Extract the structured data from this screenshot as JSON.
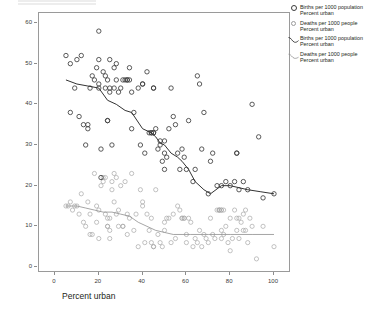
{
  "axes": {
    "y_title": "Rate per 1000",
    "x_title": "Percent urban",
    "y_ticks": [
      "0",
      "10",
      "20",
      "30",
      "40",
      "50",
      "60"
    ],
    "x_ticks": [
      "0",
      "20",
      "40",
      "60",
      "80",
      "100"
    ]
  },
  "legend": {
    "items": [
      {
        "key": "circle-dark",
        "line1": "Births per 1000 population",
        "line2": "Percent urban"
      },
      {
        "key": "circle-light",
        "line1": "Deaths per 1000 people",
        "line2": "Percent urban"
      },
      {
        "key": "curve-dark",
        "line1": "Births per 1000 population",
        "line2": "Percent urban"
      },
      {
        "key": "curve-light",
        "line1": "Deaths per 1000 people",
        "line2": "Percent urban"
      }
    ]
  },
  "colors": {
    "births_marker": "#3d3d3d",
    "deaths_marker": "#a8a8a8",
    "births_line": "#333333",
    "deaths_line": "#8f8f8f",
    "frame": "#9a9a9a",
    "background": "#ffffff"
  },
  "chart_data": {
    "type": "scatter",
    "title": "",
    "xlabel": "Percent urban",
    "ylabel": "Rate per 1000",
    "xlim": [
      0,
      100
    ],
    "ylim": [
      0,
      60
    ],
    "xticks": [
      0,
      20,
      40,
      60,
      80,
      100
    ],
    "yticks": [
      0,
      10,
      20,
      30,
      40,
      50,
      60
    ],
    "grid": false,
    "legend_position": "right-outside",
    "series": [
      {
        "name": "Births per 1000 population",
        "marker": "open-circle",
        "color": "#3d3d3d",
        "points": [
          [
            5,
            52
          ],
          [
            7,
            50
          ],
          [
            7,
            38
          ],
          [
            9,
            44
          ],
          [
            10,
            51
          ],
          [
            11,
            37
          ],
          [
            12,
            52
          ],
          [
            13,
            35
          ],
          [
            14,
            30
          ],
          [
            15,
            34
          ],
          [
            15,
            35
          ],
          [
            16,
            44
          ],
          [
            17,
            47
          ],
          [
            18,
            46
          ],
          [
            19,
            49
          ],
          [
            20,
            58
          ],
          [
            20,
            51
          ],
          [
            20,
            45
          ],
          [
            20,
            44
          ],
          [
            21,
            29
          ],
          [
            21,
            22
          ],
          [
            22,
            48
          ],
          [
            23,
            47
          ],
          [
            23,
            44
          ],
          [
            24,
            36
          ],
          [
            24,
            36
          ],
          [
            24,
            46
          ],
          [
            25,
            44
          ],
          [
            25,
            43
          ],
          [
            25,
            51
          ],
          [
            26,
            30
          ],
          [
            27,
            44
          ],
          [
            27,
            49
          ],
          [
            28,
            50
          ],
          [
            28,
            46
          ],
          [
            29,
            43
          ],
          [
            30,
            44
          ],
          [
            31,
            46
          ],
          [
            32,
            46
          ],
          [
            33,
            46
          ],
          [
            33,
            46
          ],
          [
            34,
            46
          ],
          [
            34,
            49
          ],
          [
            35,
            43
          ],
          [
            35,
            34
          ],
          [
            36,
            38
          ],
          [
            38,
            44
          ],
          [
            39,
            30
          ],
          [
            40,
            45
          ],
          [
            40,
            45
          ],
          [
            41,
            28
          ],
          [
            42,
            48
          ],
          [
            43,
            33
          ],
          [
            44,
            33
          ],
          [
            44,
            33
          ],
          [
            45,
            33
          ],
          [
            45,
            33
          ],
          [
            45,
            44
          ],
          [
            45,
            44
          ],
          [
            46,
            34
          ],
          [
            47,
            29
          ],
          [
            48,
            31
          ],
          [
            48,
            30
          ],
          [
            49,
            26
          ],
          [
            50,
            31
          ],
          [
            50,
            28
          ],
          [
            50,
            24
          ],
          [
            51,
            27
          ],
          [
            52,
            34
          ],
          [
            53,
            44
          ],
          [
            54,
            37
          ],
          [
            55,
            35
          ],
          [
            56,
            28
          ],
          [
            57,
            24
          ],
          [
            58,
            29
          ],
          [
            59,
            27
          ],
          [
            60,
            24
          ],
          [
            61,
            36
          ],
          [
            63,
            21
          ],
          [
            64,
            24
          ],
          [
            65,
            47
          ],
          [
            66,
            45
          ],
          [
            67,
            29
          ],
          [
            68,
            38
          ],
          [
            70,
            18
          ],
          [
            71,
            26
          ],
          [
            72,
            28
          ],
          [
            74,
            20
          ],
          [
            76,
            20
          ],
          [
            78,
            21
          ],
          [
            80,
            20
          ],
          [
            82,
            21
          ],
          [
            83,
            28
          ],
          [
            83,
            28
          ],
          [
            84,
            19
          ],
          [
            86,
            21
          ],
          [
            88,
            19
          ],
          [
            90,
            40
          ],
          [
            93,
            32
          ],
          [
            95,
            17
          ],
          [
            100,
            18
          ]
        ]
      },
      {
        "name": "Deaths per 1000 people",
        "marker": "open-circle",
        "color": "#a8a8a8",
        "points": [
          [
            5,
            15
          ],
          [
            6,
            15
          ],
          [
            7,
            16
          ],
          [
            8,
            14
          ],
          [
            9,
            15
          ],
          [
            10,
            15
          ],
          [
            11,
            13
          ],
          [
            12,
            18
          ],
          [
            13,
            11
          ],
          [
            14,
            10
          ],
          [
            15,
            16
          ],
          [
            16,
            13
          ],
          [
            16,
            8
          ],
          [
            17,
            8
          ],
          [
            18,
            23
          ],
          [
            19,
            15
          ],
          [
            19,
            11
          ],
          [
            20,
            14
          ],
          [
            20,
            7
          ],
          [
            21,
            20
          ],
          [
            22,
            21
          ],
          [
            22,
            22
          ],
          [
            23,
            22
          ],
          [
            23,
            13
          ],
          [
            24,
            12
          ],
          [
            24,
            10
          ],
          [
            24,
            10
          ],
          [
            25,
            12
          ],
          [
            25,
            9
          ],
          [
            25,
            7
          ],
          [
            26,
            21
          ],
          [
            26,
            19
          ],
          [
            27,
            23
          ],
          [
            27,
            16
          ],
          [
            28,
            22
          ],
          [
            28,
            13
          ],
          [
            29,
            14
          ],
          [
            29,
            10
          ],
          [
            30,
            20
          ],
          [
            31,
            10
          ],
          [
            31,
            10
          ],
          [
            32,
            21
          ],
          [
            33,
            13
          ],
          [
            33,
            8
          ],
          [
            34,
            12
          ],
          [
            35,
            23
          ],
          [
            36,
            9
          ],
          [
            37,
            13
          ],
          [
            38,
            5
          ],
          [
            39,
            19
          ],
          [
            40,
            16
          ],
          [
            40,
            15
          ],
          [
            41,
            6
          ],
          [
            42,
            13
          ],
          [
            43,
            9
          ],
          [
            44,
            12
          ],
          [
            44,
            6
          ],
          [
            45,
            5
          ],
          [
            45,
            5
          ],
          [
            46,
            19
          ],
          [
            47,
            8
          ],
          [
            48,
            6
          ],
          [
            49,
            5
          ],
          [
            50,
            11
          ],
          [
            50,
            9
          ],
          [
            51,
            12
          ],
          [
            52,
            12
          ],
          [
            53,
            6
          ],
          [
            54,
            13
          ],
          [
            55,
            7
          ],
          [
            56,
            15
          ],
          [
            57,
            14
          ],
          [
            58,
            12
          ],
          [
            58,
            12
          ],
          [
            59,
            12
          ],
          [
            59,
            12
          ],
          [
            60,
            8
          ],
          [
            60,
            6
          ],
          [
            61,
            12
          ],
          [
            62,
            11
          ],
          [
            63,
            5
          ],
          [
            64,
            7
          ],
          [
            65,
            6
          ],
          [
            66,
            9
          ],
          [
            67,
            5
          ],
          [
            68,
            8
          ],
          [
            69,
            7
          ],
          [
            70,
            6
          ],
          [
            71,
            12
          ],
          [
            72,
            8
          ],
          [
            73,
            7
          ],
          [
            74,
            14
          ],
          [
            75,
            14
          ],
          [
            75,
            14
          ],
          [
            75,
            14
          ],
          [
            76,
            14
          ],
          [
            76,
            14
          ],
          [
            76,
            9
          ],
          [
            76,
            7
          ],
          [
            77,
            14
          ],
          [
            77,
            8
          ],
          [
            78,
            10
          ],
          [
            79,
            6
          ],
          [
            80,
            4
          ],
          [
            80,
            12
          ],
          [
            81,
            7
          ],
          [
            82,
            14
          ],
          [
            83,
            12
          ],
          [
            83,
            9
          ],
          [
            84,
            12
          ],
          [
            84,
            7
          ],
          [
            85,
            11
          ],
          [
            86,
            13
          ],
          [
            86,
            9
          ],
          [
            87,
            14
          ],
          [
            87,
            9
          ],
          [
            88,
            6
          ],
          [
            89,
            12
          ],
          [
            90,
            10
          ],
          [
            92,
            2
          ],
          [
            95,
            10
          ],
          [
            100,
            5
          ]
        ]
      }
    ],
    "smoothers": [
      {
        "name": "Births per 1000 population",
        "type": "loess",
        "color": "#333333",
        "points": [
          [
            5,
            46
          ],
          [
            10,
            45
          ],
          [
            15,
            44.5
          ],
          [
            20,
            44
          ],
          [
            24,
            41
          ],
          [
            28,
            40
          ],
          [
            32,
            38.5
          ],
          [
            35,
            38
          ],
          [
            40,
            34
          ],
          [
            44,
            33
          ],
          [
            46,
            32
          ],
          [
            48,
            30.5
          ],
          [
            50,
            30
          ],
          [
            53,
            28
          ],
          [
            56,
            27
          ],
          [
            58,
            26
          ],
          [
            61,
            24
          ],
          [
            64,
            21
          ],
          [
            68,
            19
          ],
          [
            71,
            18
          ],
          [
            76,
            20
          ],
          [
            80,
            20
          ],
          [
            84,
            19.5
          ],
          [
            88,
            19
          ],
          [
            94,
            18.5
          ],
          [
            100,
            18
          ]
        ]
      },
      {
        "name": "Deaths per 1000 people",
        "type": "loess",
        "color": "#8f8f8f",
        "points": [
          [
            5,
            15
          ],
          [
            10,
            15
          ],
          [
            14,
            14.5
          ],
          [
            18,
            14
          ],
          [
            22,
            13.5
          ],
          [
            26,
            13.5
          ],
          [
            30,
            13
          ],
          [
            34,
            12.5
          ],
          [
            38,
            11
          ],
          [
            42,
            10
          ],
          [
            46,
            9
          ],
          [
            50,
            8.5
          ],
          [
            54,
            8
          ],
          [
            58,
            8
          ],
          [
            62,
            8
          ],
          [
            70,
            8
          ],
          [
            80,
            8
          ],
          [
            90,
            8
          ],
          [
            100,
            8
          ]
        ]
      }
    ]
  }
}
